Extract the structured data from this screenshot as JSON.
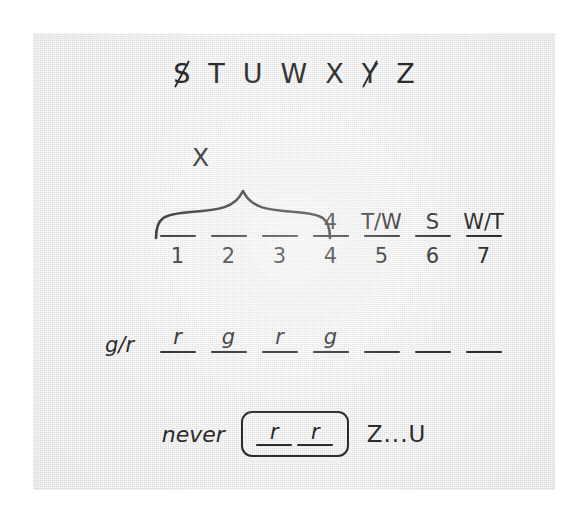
{
  "worksheet": {
    "alphabet_row": {
      "name": "alphabet-strip",
      "letters": [
        {
          "char": "S",
          "struck": true
        },
        {
          "char": "T",
          "struck": false
        },
        {
          "char": "U",
          "struck": false
        },
        {
          "char": "W",
          "struck": false
        },
        {
          "char": "X",
          "struck": false
        },
        {
          "char": "Y",
          "struck": true
        },
        {
          "char": "Z",
          "struck": false
        }
      ]
    },
    "brace": {
      "label": "X",
      "spans_positions": "1-3"
    },
    "grid": {
      "columns": [
        {
          "number": "1",
          "clue": ""
        },
        {
          "number": "2",
          "clue": ""
        },
        {
          "number": "3",
          "clue": ""
        },
        {
          "number": "4",
          "clue": "4"
        },
        {
          "number": "5",
          "clue": "T/W"
        },
        {
          "number": "6",
          "clue": "S"
        },
        {
          "number": "7",
          "clue": "W/T"
        }
      ]
    },
    "gr_row": {
      "label": "g/r",
      "values": [
        "r",
        "g",
        "r",
        "g",
        "",
        "",
        ""
      ]
    },
    "never_row": {
      "label": "never",
      "boxed_values": [
        "r",
        "r"
      ],
      "tail": "Z...U"
    }
  },
  "colors": {
    "ink": "#2b2b2b",
    "paper": "#e9e9e9",
    "frame": "#ffffff"
  }
}
